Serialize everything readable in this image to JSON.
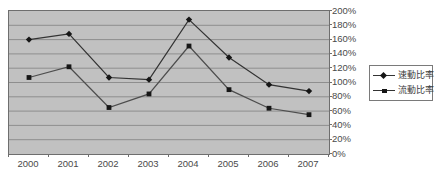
{
  "chart_data": {
    "type": "line",
    "title": "",
    "xlabel": "",
    "ylabel": "",
    "categories": [
      "2000",
      "2001",
      "2002",
      "2003",
      "2004",
      "2005",
      "2006",
      "2007"
    ],
    "series": [
      {
        "name": "速動比率",
        "marker": "diamond",
        "color": "#333333",
        "values": [
          160,
          168,
          107,
          104,
          188,
          135,
          97,
          88
        ]
      },
      {
        "name": "流動比率",
        "marker": "square",
        "color": "#4d4d4d",
        "values": [
          107,
          122,
          65,
          84,
          151,
          90,
          64,
          55
        ]
      }
    ],
    "ylim": [
      0,
      200
    ],
    "ytick_step": 20,
    "ytick_labels_top_to_bottom": [
      "200%",
      "180%",
      "160%",
      "140%",
      "120%",
      "100%",
      "80%",
      "60%",
      "40%",
      "20%",
      "0%"
    ],
    "grid": "horizontal",
    "grid_color": "#8e8e8e",
    "plot_bg": "#c1c1c1",
    "legend_position": "right"
  }
}
